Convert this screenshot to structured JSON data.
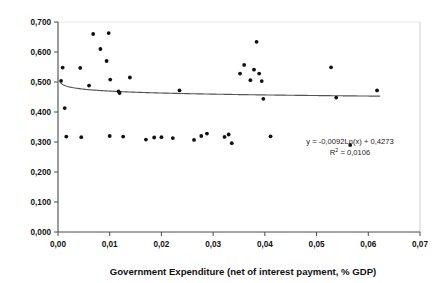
{
  "chart_data": {
    "type": "scatter",
    "title": "",
    "xlabel": "Government Expenditure (net of interest payment, % GDP)",
    "ylabel": "Growth Rate",
    "xlim": [
      0.0,
      0.07
    ],
    "ylim": [
      0.0,
      0.7
    ],
    "grid": false,
    "legend": null,
    "decimal_separator": ",",
    "xticks": [
      0.0,
      0.01,
      0.02,
      0.03,
      0.04,
      0.05,
      0.06,
      0.07
    ],
    "xticklabels": [
      "0,00",
      "0,01",
      "0,02",
      "0,03",
      "0,04",
      "0,05",
      "0,06",
      "0,07"
    ],
    "yticks": [
      0.0,
      0.1,
      0.2,
      0.3,
      0.4,
      0.5,
      0.6,
      0.7
    ],
    "yticklabels": [
      "0,000",
      "0,100",
      "0,200",
      "0,300",
      "0,400",
      "0,500",
      "0,600",
      "0,700"
    ],
    "points": [
      {
        "x": 0.0006,
        "y": 0.504
      },
      {
        "x": 0.0009,
        "y": 0.548
      },
      {
        "x": 0.0013,
        "y": 0.413
      },
      {
        "x": 0.0016,
        "y": 0.318
      },
      {
        "x": 0.0043,
        "y": 0.547
      },
      {
        "x": 0.0045,
        "y": 0.316
      },
      {
        "x": 0.006,
        "y": 0.488
      },
      {
        "x": 0.0068,
        "y": 0.66
      },
      {
        "x": 0.0082,
        "y": 0.61
      },
      {
        "x": 0.0094,
        "y": 0.57
      },
      {
        "x": 0.0098,
        "y": 0.663
      },
      {
        "x": 0.0101,
        "y": 0.508
      },
      {
        "x": 0.01,
        "y": 0.32
      },
      {
        "x": 0.0117,
        "y": 0.469
      },
      {
        "x": 0.0119,
        "y": 0.463
      },
      {
        "x": 0.0126,
        "y": 0.318
      },
      {
        "x": 0.0139,
        "y": 0.515
      },
      {
        "x": 0.017,
        "y": 0.308
      },
      {
        "x": 0.0186,
        "y": 0.315
      },
      {
        "x": 0.02,
        "y": 0.316
      },
      {
        "x": 0.0222,
        "y": 0.313
      },
      {
        "x": 0.0235,
        "y": 0.472
      },
      {
        "x": 0.0263,
        "y": 0.307
      },
      {
        "x": 0.0277,
        "y": 0.32
      },
      {
        "x": 0.0288,
        "y": 0.328
      },
      {
        "x": 0.0322,
        "y": 0.317
      },
      {
        "x": 0.033,
        "y": 0.325
      },
      {
        "x": 0.0336,
        "y": 0.296
      },
      {
        "x": 0.0352,
        "y": 0.528
      },
      {
        "x": 0.036,
        "y": 0.557
      },
      {
        "x": 0.0372,
        "y": 0.506
      },
      {
        "x": 0.0379,
        "y": 0.541
      },
      {
        "x": 0.0384,
        "y": 0.634
      },
      {
        "x": 0.0389,
        "y": 0.528
      },
      {
        "x": 0.0394,
        "y": 0.503
      },
      {
        "x": 0.0397,
        "y": 0.444
      },
      {
        "x": 0.0411,
        "y": 0.319
      },
      {
        "x": 0.0528,
        "y": 0.549
      },
      {
        "x": 0.0538,
        "y": 0.448
      },
      {
        "x": 0.0565,
        "y": 0.29
      },
      {
        "x": 0.0617,
        "y": 0.472
      }
    ],
    "trendline": {
      "type": "logarithmic",
      "equation": "y = -0,0092Ln(x) + 0,4273",
      "r_squared_label": "R",
      "r_squared_exponent": "2",
      "r_squared_value": "= 0,0106",
      "coefficient": -0.0092,
      "intercept": 0.4273,
      "r_squared": 0.0106
    }
  }
}
